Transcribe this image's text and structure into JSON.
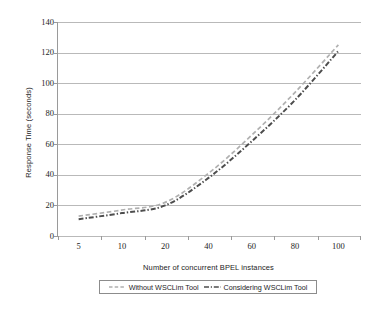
{
  "chart_data": {
    "type": "line",
    "title": "",
    "xlabel": "Number of concurrent BPEL instances",
    "ylabel": "Response Time (seconds)",
    "categories": [
      "5",
      "10",
      "20",
      "40",
      "60",
      "80",
      "100"
    ],
    "ylim": [
      0,
      140
    ],
    "yticks": [
      0,
      20,
      40,
      60,
      80,
      100,
      120,
      140
    ],
    "grid": true,
    "legend_position": "bottom",
    "series": [
      {
        "name": "Without WSCLim Tool",
        "color": "#b0b0b0",
        "style": "dashed",
        "values": [
          13,
          17,
          22,
          41,
          66,
          94,
          125
        ]
      },
      {
        "name": "Considering WSCLim Tool",
        "color": "#4d4d4d",
        "style": "dash-dot",
        "values": [
          11,
          15,
          20,
          38,
          62,
          89,
          121
        ]
      }
    ]
  },
  "axis": {
    "y_labels": [
      "140",
      "120",
      "100",
      "80",
      "60",
      "40",
      "20",
      "0"
    ],
    "x_labels": [
      "5",
      "10",
      "20",
      "40",
      "60",
      "80",
      "100"
    ],
    "y_title": "Response Time (seconds)",
    "x_title": "Number of concurrent BPEL instances"
  },
  "legend": {
    "entries": [
      {
        "label": "Without WSCLim Tool"
      },
      {
        "label": "Considering WSCLim Tool"
      }
    ]
  },
  "colors": {
    "series_1": "#b0b0b0",
    "series_2": "#4d4d4d",
    "gridline": "#b9b9b9",
    "axis": "#9a9a9a",
    "text": "#1d1d1d",
    "background": "#ffffff"
  }
}
